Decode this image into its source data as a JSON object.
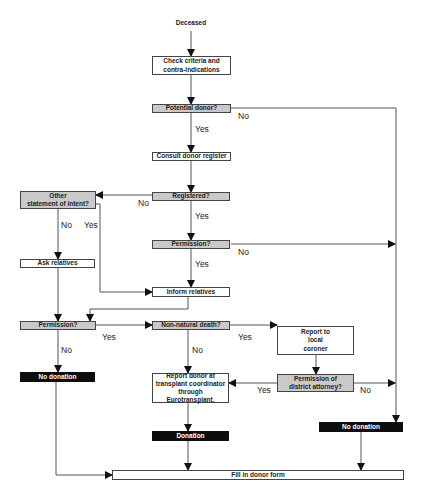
{
  "nodes": {
    "deceased": "Deceased",
    "check_criteria": "Check criteria and\ncontra-indications",
    "potential_donor": "Potential donor?",
    "consult_register": "Consult donor register",
    "registered": "Registered?",
    "other_statement": "Other\nstatement of intent?",
    "permission_1": "Permission?",
    "ask_relatives": "Ask relatives",
    "inform_relatives": "Inform relatives",
    "permission_2": "Permission?",
    "non_natural_death": "Non-natural death?",
    "report_coroner": "Report to\nlocal\ncoroner",
    "no_donation_left": "No donation",
    "report_donor": "Report donor at\ntransplant coordinator\nthrough\nEurotransplant.",
    "permission_da": "Permission of\ndistrict attorney?",
    "donation": "Donation",
    "no_donation_right": "No donation",
    "fill_form": "Fill in  donor form"
  },
  "labels": {
    "potential_no": "No",
    "potential_yes": "Yes",
    "registered_no": "No",
    "registered_yes": "Yes",
    "other_no": "No",
    "other_yes": "Yes",
    "perm1_no": "No",
    "perm1_yes": "Yes",
    "perm2_yes": "Yes",
    "perm2_no": "No",
    "nonnatural_yes": "Yes",
    "nonnatural_no": "No",
    "da_yes": "Yes",
    "da_no": "No"
  },
  "colors": {
    "decision_fill": "#c9c9c9",
    "terminal_fill": "#0d0d0d",
    "line": "#444444"
  }
}
